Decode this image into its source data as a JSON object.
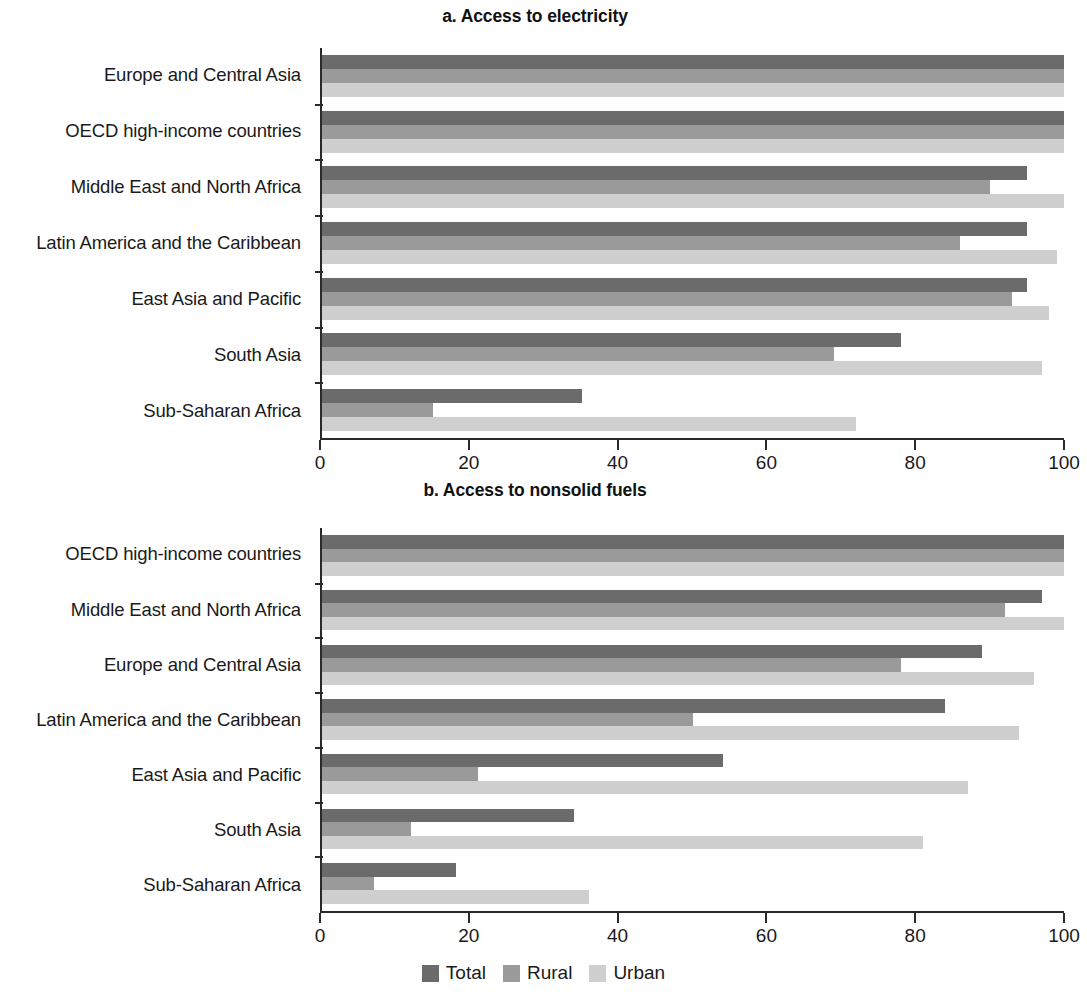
{
  "figure": {
    "background": "#ffffff",
    "legend": {
      "position": "bottom-center",
      "items": [
        {
          "key": "total",
          "label": "Total",
          "color": "#6b6b6b"
        },
        {
          "key": "rural",
          "label": "Rural",
          "color": "#9a9a9a"
        },
        {
          "key": "urban",
          "label": "Urban",
          "color": "#cfcfcf"
        }
      ]
    }
  },
  "chart_data": [
    {
      "id": "a",
      "type": "bar",
      "orientation": "horizontal",
      "title": "a. Access to electricity",
      "xlabel": "",
      "ylabel": "",
      "xlim": [
        0,
        100
      ],
      "xticks": [
        0,
        20,
        40,
        60,
        80,
        100
      ],
      "xticklabels": [
        "0",
        "20",
        "40",
        "60",
        "80",
        "100"
      ],
      "grid": false,
      "categories": [
        "Europe and Central Asia",
        "OECD high-income countries",
        "Middle East and North Africa",
        "Latin America and the Caribbean",
        "East Asia and Pacific",
        "South Asia",
        "Sub-Saharan Africa"
      ],
      "series": [
        {
          "name": "Total",
          "color": "#6b6b6b",
          "values": [
            100,
            100,
            95,
            95,
            95,
            78,
            35
          ]
        },
        {
          "name": "Rural",
          "color": "#9a9a9a",
          "values": [
            100,
            100,
            90,
            86,
            93,
            69,
            15
          ]
        },
        {
          "name": "Urban",
          "color": "#cfcfcf",
          "values": [
            100,
            100,
            100,
            99,
            98,
            97,
            72
          ]
        }
      ]
    },
    {
      "id": "b",
      "type": "bar",
      "orientation": "horizontal",
      "title": "b. Access to nonsolid fuels",
      "xlabel": "",
      "ylabel": "",
      "xlim": [
        0,
        100
      ],
      "xticks": [
        0,
        20,
        40,
        60,
        80,
        100
      ],
      "xticklabels": [
        "0",
        "20",
        "40",
        "60",
        "80",
        "100"
      ],
      "grid": false,
      "categories": [
        "OECD high-income countries",
        "Middle East and North Africa",
        "Europe and Central Asia",
        "Latin America and the Caribbean",
        "East Asia and Pacific",
        "South Asia",
        "Sub-Saharan Africa"
      ],
      "series": [
        {
          "name": "Total",
          "color": "#6b6b6b",
          "values": [
            100,
            97,
            89,
            84,
            54,
            34,
            18
          ]
        },
        {
          "name": "Rural",
          "color": "#9a9a9a",
          "values": [
            100,
            92,
            78,
            50,
            21,
            12,
            7
          ]
        },
        {
          "name": "Urban",
          "color": "#cfcfcf",
          "values": [
            100,
            100,
            96,
            94,
            87,
            81,
            36
          ]
        }
      ]
    }
  ]
}
